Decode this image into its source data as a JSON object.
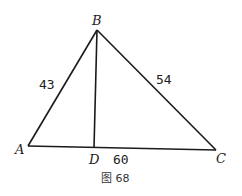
{
  "diagram": {
    "type": "triangle",
    "vertices": {
      "A": {
        "label": "A",
        "x": 28,
        "y": 146
      },
      "B": {
        "label": "B",
        "x": 97,
        "y": 30
      },
      "C": {
        "label": "C",
        "x": 216,
        "y": 150
      },
      "D": {
        "label": "D",
        "x": 94,
        "y": 148
      }
    },
    "segments": [
      {
        "from": "A",
        "to": "B",
        "length_label": "43"
      },
      {
        "from": "B",
        "to": "C",
        "length_label": "54"
      },
      {
        "from": "A",
        "to": "C",
        "length_label": "60"
      },
      {
        "from": "B",
        "to": "D",
        "length_label": ""
      }
    ],
    "labels": {
      "AB": "43",
      "BC": "54",
      "AC": "60"
    },
    "caption": "图 68"
  }
}
